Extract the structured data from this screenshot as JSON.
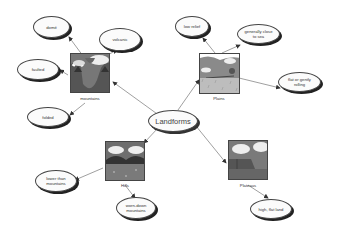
{
  "diagram": {
    "center": {
      "label": "Landforms"
    },
    "categories": [
      {
        "id": "mountains",
        "label": "mountains",
        "details": [
          "domé",
          "volcanic",
          "faulted",
          "folded"
        ]
      },
      {
        "id": "plains",
        "label": "Plains",
        "details": [
          "low relief",
          "generally close to sea",
          "flat or gently rolling"
        ]
      },
      {
        "id": "hills",
        "label": "Hills",
        "details": [
          "lower than mountains",
          "worn-down mountains"
        ]
      },
      {
        "id": "plateaus",
        "label": "Plateaus",
        "details": [
          "high, flat land"
        ]
      }
    ]
  },
  "colors": {
    "background": "#ffffff",
    "node_fill": "#fbfbfb",
    "node_border": "#444444",
    "link": "#777777"
  }
}
